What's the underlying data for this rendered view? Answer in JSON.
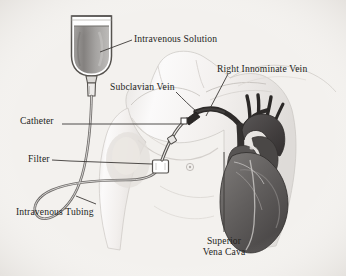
{
  "figure": {
    "background_color": "#f3f1ee",
    "ink_color": "#231f1d"
  },
  "labels": {
    "intravenous_solution": "Intravenous Solution",
    "subclavian_vein": "Subclavian Vein",
    "right_innominate_vein": "Right Innominate Vein",
    "catheter": "Catheter",
    "filter": "Filter",
    "intravenous_tubing": "Intravenous Tubing",
    "superior_vena_cava_line1": "Superior",
    "superior_vena_cava_line2": "Vena Cava"
  },
  "parts": {
    "iv_bottle": {
      "name": "intravenous-solution-bottle",
      "fluid_color": "#8d8d8d",
      "airspace_color": "#fbfafa",
      "outline_color": "#4a4746"
    },
    "drip_chamber": {
      "name": "drip-chamber",
      "color": "#cfcdca"
    },
    "tubing": {
      "name": "intravenous-tubing",
      "color": "#6e6b69"
    },
    "filter_box": {
      "name": "inline-filter",
      "fill": "#ffffff",
      "outline": "#55524f"
    },
    "catheter": {
      "name": "catheter-line",
      "color": "#3a3735"
    },
    "torso": {
      "name": "patient-torso",
      "fill": "#fafafa",
      "shade": "#d8d5d2"
    },
    "heart": {
      "name": "heart",
      "fill": "#6a6766",
      "dark": "#393635"
    },
    "vessels": {
      "name": "great-vessels",
      "color": "#2e2b2a"
    }
  },
  "leaders": {
    "style": "thin straight pointer lines",
    "color": "#3d3a38"
  }
}
